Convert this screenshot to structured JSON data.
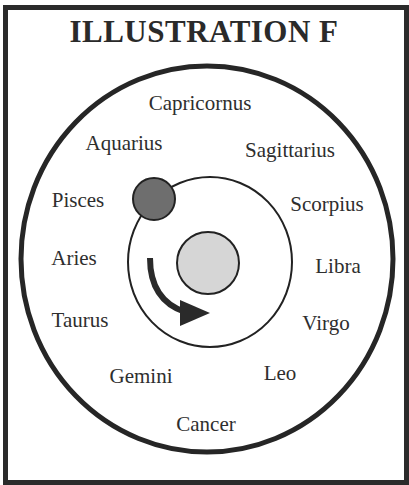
{
  "title": "ILLUSTRATION F",
  "colors": {
    "frame": "#2b2b2b",
    "orbit_line": "#222222",
    "moon_fill": "#6e6e6e",
    "sun_fill": "#d6d6d6",
    "arrow": "#2a2a2a",
    "text": "#2e2e2e"
  },
  "constellations": [
    {
      "name": "Capricornus",
      "x": 200,
      "y": 103
    },
    {
      "name": "Aquarius",
      "x": 124,
      "y": 143
    },
    {
      "name": "Sagittarius",
      "x": 290,
      "y": 150
    },
    {
      "name": "Pisces",
      "x": 78,
      "y": 200
    },
    {
      "name": "Scorpius",
      "x": 327,
      "y": 204
    },
    {
      "name": "Aries",
      "x": 74,
      "y": 258
    },
    {
      "name": "Libra",
      "x": 338,
      "y": 266
    },
    {
      "name": "Taurus",
      "x": 80,
      "y": 320
    },
    {
      "name": "Virgo",
      "x": 326,
      "y": 323
    },
    {
      "name": "Gemini",
      "x": 141,
      "y": 376
    },
    {
      "name": "Leo",
      "x": 280,
      "y": 373
    },
    {
      "name": "Cancer",
      "x": 206,
      "y": 424
    }
  ],
  "diagram": {
    "zodiac_ring": {
      "cx": 207,
      "cy": 259,
      "rx": 186,
      "ry": 193
    },
    "orbit": {
      "cx": 210,
      "cy": 262,
      "rx": 82,
      "ry": 85
    },
    "sun": {
      "cx": 208,
      "cy": 263,
      "r": 31
    },
    "moon": {
      "cx": 154,
      "cy": 199,
      "r": 21
    },
    "direction": "clockwise"
  }
}
